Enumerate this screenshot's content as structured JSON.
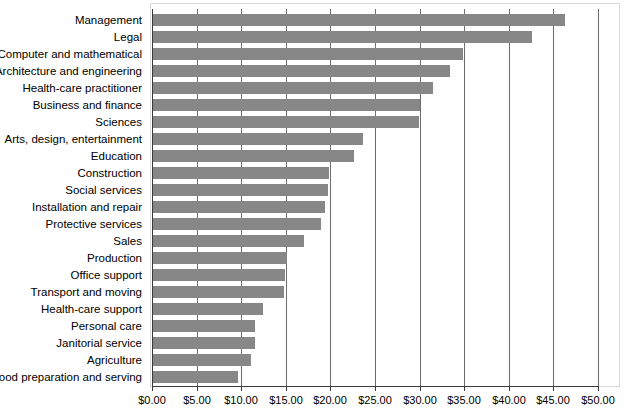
{
  "chart_data": {
    "type": "bar",
    "orientation": "horizontal",
    "title": "",
    "subtitle": "",
    "xlabel": "",
    "ylabel": "",
    "xlim": [
      0,
      50
    ],
    "ylim": null,
    "grid": true,
    "legend": null,
    "legend_position": "none",
    "x_tick_labels": [
      "$0.00",
      "$5.00",
      "$10.00",
      "$15.00",
      "$20.00",
      "$25.00",
      "$30.00",
      "$35.00",
      "$40.00",
      "$45.00",
      "$50.00"
    ],
    "x_tick_values": [
      0,
      5,
      10,
      15,
      20,
      25,
      30,
      35,
      40,
      45,
      50
    ],
    "categories": [
      "Management",
      "Legal",
      "Computer and mathematical",
      "Architecture and engineering",
      "Health-care practitioner",
      "Business and finance",
      "Sciences",
      "Arts, design, entertainment",
      "Education",
      "Construction",
      "Social services",
      "Installation and repair",
      "Protective services",
      "Sales",
      "Production",
      "Office support",
      "Transport and moving",
      "Health-care support",
      "Personal care",
      "Janitorial service",
      "Agriculture",
      "Food preparation and serving"
    ],
    "values": [
      46.3,
      42.6,
      34.9,
      33.4,
      31.5,
      30.1,
      29.9,
      23.7,
      22.6,
      19.8,
      19.7,
      19.4,
      19.0,
      17.0,
      15.1,
      14.9,
      14.8,
      12.4,
      11.6,
      11.5,
      11.1,
      9.6
    ],
    "bar_color": "#878787",
    "gridline_color": "#6d6d6d",
    "axis_color": "#3a3a3a",
    "frame_color": "#d8d8d8",
    "background_color": "#ffffff"
  }
}
